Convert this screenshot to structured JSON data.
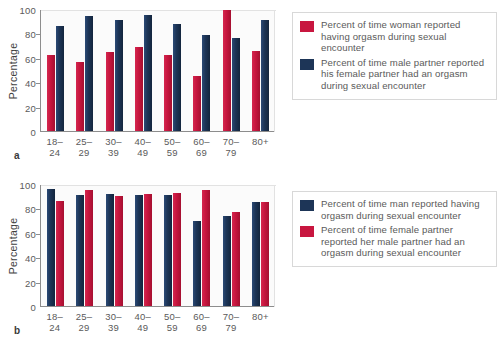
{
  "figure": {
    "panels": [
      {
        "letter": "a",
        "ylabel": "Percentage",
        "yticks": [
          "100",
          "80",
          "60",
          "40",
          "20",
          "0"
        ],
        "legend": [
          {
            "color": "#c8163f",
            "swatch": "red",
            "text": "Percent of time woman reported having orgasm during sexual encounter"
          },
          {
            "color": "#1d3557",
            "swatch": "navy",
            "text": "Percent of time male partner reported his female partner had an orgasm during sexual encounter"
          }
        ]
      },
      {
        "letter": "b",
        "ylabel": "Percentage",
        "yticks": [
          "100",
          "80",
          "60",
          "40",
          "20",
          "0"
        ],
        "legend": [
          {
            "color": "#1d3557",
            "swatch": "navy",
            "text": "Percent of time man reported having orgasm during sexual encounter"
          },
          {
            "color": "#c8163f",
            "swatch": "red",
            "text": "Percent of time female partner reported her male partner had an orgasm during sexual encounter"
          }
        ]
      }
    ]
  },
  "chart_data": [
    {
      "type": "bar",
      "panel": "a",
      "title": "",
      "xlabel": "",
      "ylabel": "Percentage",
      "ylim": [
        0,
        100
      ],
      "yticks": [
        0,
        20,
        40,
        60,
        80,
        100
      ],
      "grid": false,
      "legend_position": "right",
      "categories": [
        "18–24",
        "25–29",
        "30–39",
        "40–49",
        "50–59",
        "60–69",
        "70–79",
        "80+"
      ],
      "series": [
        {
          "name": "Percent of time woman reported having orgasm during sexual encounter",
          "color": "#c8163f",
          "values": [
            62,
            57,
            65,
            69,
            62,
            45,
            99,
            66
          ]
        },
        {
          "name": "Percent of time male partner reported his female partner had an orgasm during sexual encounter",
          "color": "#1d3557",
          "values": [
            86,
            94,
            91,
            95,
            88,
            79,
            76,
            91
          ]
        }
      ]
    },
    {
      "type": "bar",
      "panel": "b",
      "title": "",
      "xlabel": "",
      "ylabel": "Percentage",
      "ylim": [
        0,
        100
      ],
      "yticks": [
        0,
        20,
        40,
        60,
        80,
        100
      ],
      "grid": false,
      "legend_position": "right",
      "categories": [
        "18–24",
        "25–29",
        "30–39",
        "40–49",
        "50–59",
        "60–69",
        "70–79",
        "80+"
      ],
      "series": [
        {
          "name": "Percent of time man reported having orgasm during sexual encounter",
          "color": "#1d3557",
          "values": [
            96,
            91,
            92,
            91,
            91,
            70,
            74,
            85
          ]
        },
        {
          "name": "Percent of time female partner reported her male partner had an orgasm during sexual encounter",
          "color": "#c8163f",
          "values": [
            86,
            95,
            90,
            92,
            93,
            95,
            77,
            85
          ]
        }
      ]
    }
  ]
}
